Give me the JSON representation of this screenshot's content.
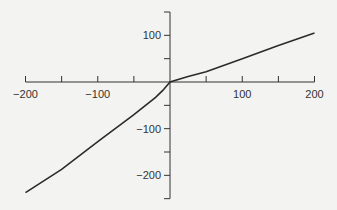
{
  "chart_data": {
    "type": "line",
    "title": "",
    "xlabel": "",
    "ylabel": "",
    "xlim": [
      -200,
      200
    ],
    "ylim": [
      -250,
      150
    ],
    "grid": false,
    "axes_style": "cross-at-origin",
    "x_ticks": [
      -200,
      -150,
      -100,
      -50,
      0,
      50,
      100,
      150,
      200
    ],
    "x_tick_labels": [
      {
        "value": -200,
        "label": "−200"
      },
      {
        "value": -100,
        "label": "−100"
      },
      {
        "value": 100,
        "label": "100"
      },
      {
        "value": 200,
        "label": "200"
      }
    ],
    "y_ticks": [
      150,
      100,
      50,
      0,
      -50,
      -100,
      -150,
      -200,
      -250
    ],
    "y_tick_labels": [
      {
        "value": 100,
        "label": "100"
      },
      {
        "value": -100,
        "label": "−100"
      },
      {
        "value": -200,
        "label": "−200"
      }
    ],
    "series": [
      {
        "name": "curve",
        "color": "#2b2b2b",
        "x": [
          -200,
          -150,
          -100,
          -50,
          -20,
          -10,
          0,
          25,
          50,
          100,
          150,
          200
        ],
        "y": [
          -237,
          -187,
          -128,
          -70,
          -33,
          -18,
          0,
          12,
          22,
          50,
          78,
          105
        ]
      }
    ]
  },
  "colors": {
    "axis": "#333333",
    "line": "#2b2b2b",
    "background": "#f3f3f1"
  }
}
